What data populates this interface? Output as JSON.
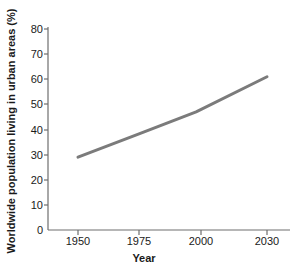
{
  "chart_data": {
    "type": "line",
    "title": "",
    "xlabel": "Year",
    "ylabel": "Worldwide population living in urban areas (%)",
    "x": [
      1950,
      1975,
      2000,
      2030
    ],
    "values": [
      29,
      38,
      47,
      61
    ],
    "series": [
      {
        "name": "Worldwide urban population share",
        "values": [
          29,
          38,
          47,
          61
        ]
      }
    ],
    "xtick_labels": [
      "1950",
      "1975",
      "2000",
      "2030"
    ],
    "xticks": [
      1950,
      1975,
      2000,
      2030
    ],
    "ytick_labels": [
      "0",
      "10",
      "20",
      "30",
      "40",
      "50",
      "60",
      "70",
      "80"
    ],
    "yticks": [
      0,
      10,
      20,
      30,
      40,
      50,
      60,
      70,
      80
    ],
    "xlim": [
      1950,
      2030
    ],
    "ylim": [
      0,
      80
    ],
    "grid": false,
    "legend": "none",
    "line_color": "#7b7b7b",
    "axis_color": "#6e6e6e",
    "text_color": "#1a1a1a",
    "background_color": "#ffffff"
  },
  "axes": {
    "x_title": "Year",
    "y_title": "Worldwide population living in urban areas (%)",
    "x_ticks": [
      {
        "label": "1950",
        "px": 78
      },
      {
        "label": "1975",
        "px": 139
      },
      {
        "label": "2000",
        "px": 201
      },
      {
        "label": "2030",
        "px": 267
      }
    ],
    "y_ticks": [
      {
        "label": "80",
        "px": 29
      },
      {
        "label": "70",
        "px": 54
      },
      {
        "label": "60",
        "px": 79
      },
      {
        "label": "50",
        "px": 104
      },
      {
        "label": "40",
        "px": 130
      },
      {
        "label": "30",
        "px": 155
      },
      {
        "label": "20",
        "px": 180
      },
      {
        "label": "10",
        "px": 205
      },
      {
        "label": "0",
        "px": 230
      }
    ]
  }
}
